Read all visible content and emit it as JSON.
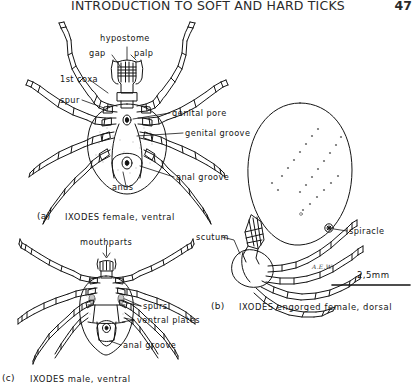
{
  "page": {
    "running_head": "INTRODUCTION TO SOFT AND HARD TICKS",
    "page_number": "47",
    "ink_color": "#141414",
    "paper_color": "#ffffff"
  },
  "figures": [
    {
      "id": "a",
      "caption_marker": "(a)",
      "caption_text": "IXODES female, ventral",
      "labels": [
        {
          "key": "hypostome",
          "text": "hypostome"
        },
        {
          "key": "palp",
          "text": "palp"
        },
        {
          "key": "gap",
          "text": "gap"
        },
        {
          "key": "first-coxa",
          "text": "1st coxa"
        },
        {
          "key": "spur",
          "text": "spur"
        },
        {
          "key": "genital-pore",
          "text": "genital pore"
        },
        {
          "key": "genital-groove",
          "text": "genital groove"
        },
        {
          "key": "anus",
          "text": "anus"
        },
        {
          "key": "anal-groove",
          "text": "anal groove"
        }
      ]
    },
    {
      "id": "b",
      "caption_marker": "(b)",
      "caption_text": "IXODES engorged female, dorsal",
      "labels": [
        {
          "key": "scutum",
          "text": "scutum"
        },
        {
          "key": "spiracle",
          "text": "spiracle"
        }
      ],
      "scale_bar": "2,5mm",
      "artist_signature": "A.E.W."
    },
    {
      "id": "c",
      "caption_marker": "(c)",
      "caption_text": "IXODES male, ventral",
      "labels": [
        {
          "key": "mouthparts",
          "text": "mouthparts"
        },
        {
          "key": "spurs",
          "text": "spurs"
        },
        {
          "key": "ventral-plates",
          "text": "ventral plates"
        },
        {
          "key": "anal-groove",
          "text": "anal groove"
        }
      ]
    }
  ]
}
